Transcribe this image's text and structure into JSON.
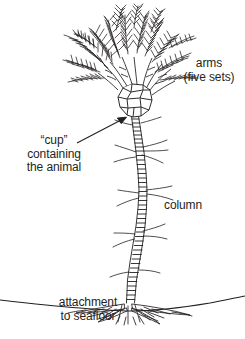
{
  "figure": {
    "caption_present": false,
    "background_color": "#ffffff",
    "ink_color": "#231f20",
    "width": 245,
    "height": 339
  },
  "labels": {
    "arms": {
      "line1": "arms",
      "line2": "(five sets)",
      "has_leader": false
    },
    "cup": {
      "line1": "“cup”",
      "line2": "containing",
      "line3": "the animal",
      "has_leader": true
    },
    "column": {
      "line1": "column",
      "has_leader": false
    },
    "attachment": {
      "line1": "attachment",
      "line2": "to seafloor",
      "has_leader": false
    }
  },
  "parts": {
    "crown": "feathery pinnate arms radiating upward in five sets",
    "calyx": "polygonal plated cup holding the animal's body",
    "stalk": "segmented column with thin cirri branches",
    "holdfast": "radiating root-like attachment spreading on the seafloor",
    "seafloor": "horizontal sediment line across the base"
  }
}
